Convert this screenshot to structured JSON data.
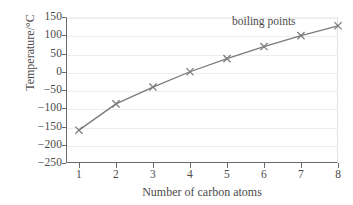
{
  "chart_data": {
    "type": "line",
    "title": "",
    "xlabel": "Number of carbon atoms",
    "ylabel": "Temperature/°C",
    "x": [
      1,
      2,
      3,
      4,
      5,
      6,
      7,
      8
    ],
    "series": [
      {
        "name": "boiling points",
        "values": [
          -160,
          -88,
          -42,
          0,
          36,
          69,
          99,
          126
        ]
      }
    ],
    "xlim": [
      0.65,
      8
    ],
    "ylim": [
      -250,
      150
    ],
    "xticks": [
      1,
      2,
      3,
      4,
      5,
      6,
      7,
      8
    ],
    "xtick_labels": [
      "1",
      "2",
      "3",
      "4",
      "5",
      "6",
      "7",
      "8"
    ],
    "yticks": [
      150,
      100,
      50,
      0,
      -50,
      -100,
      -150,
      -200,
      -250
    ],
    "ytick_labels": [
      "150",
      "100",
      "50",
      "0",
      "−50",
      "−100",
      "−150",
      "−200",
      "−250"
    ],
    "grid": "horizontal",
    "legend_position": "none",
    "annotations": [
      {
        "text": "boiling points",
        "x": 7.0,
        "y": 140
      }
    ],
    "marker": "x-cross",
    "colors": {
      "line": "#7a7a7a",
      "marker": "#7a7a7a",
      "grid": "#ededed",
      "axis": "#6a6a6a",
      "text": "#4b4b4b",
      "background": "#ffffff"
    }
  }
}
